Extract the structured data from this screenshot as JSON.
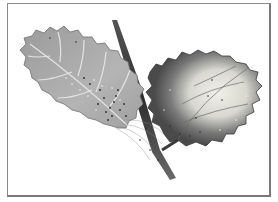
{
  "figure": {
    "leaves": [
      {
        "name": "left-leaf",
        "description": "light grey-green leaf with pale veins and scattered dark specks near base"
      },
      {
        "name": "right-leaf",
        "description": "dark leaf with pale yellowish center and speckled margins"
      }
    ],
    "colors": {
      "left_leaf": "#a9a9a9",
      "left_leaf_vein": "#e2e2e2",
      "right_leaf_edge": "#4a4a4a",
      "right_leaf_center": "#e8e8e0",
      "stem": "#3a3a3a",
      "frame": "#8a8a8a"
    }
  }
}
